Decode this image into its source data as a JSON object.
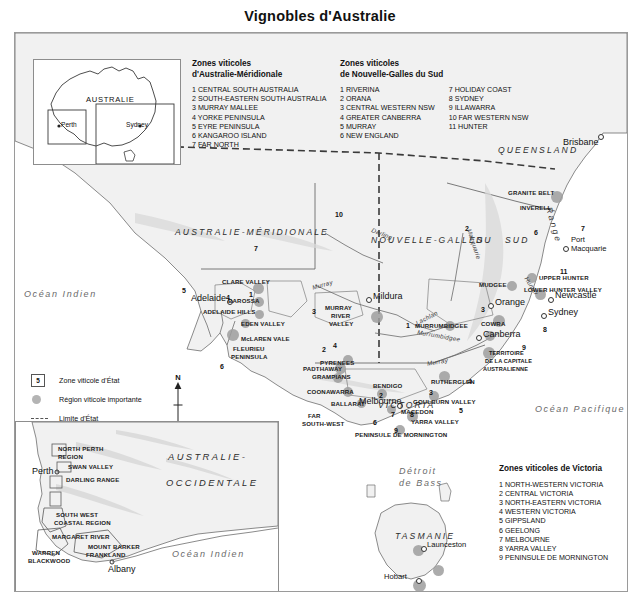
{
  "title": "Vignobles d'Australie",
  "legends": {
    "south_australia": {
      "title_line1": "Zones viticoles",
      "title_line2": "d'Australie-Méridionale",
      "items": [
        "1 CENTRAL SOUTH AUSTRALIA",
        "2 SOUTH-EASTERN SOUTH AUSTRALIA",
        "3 MURRAY MALLEE",
        "4 YORKE PENINSULA",
        "5 EYRE PENINSULA",
        "6 KANGAROO ISLAND",
        "7 FAR NORTH"
      ]
    },
    "new_south_wales": {
      "title_line1": "Zones viticoles",
      "title_line2": "de Nouvelle-Galles du Sud",
      "items_col1": [
        "1 RIVERINA",
        "2 ORANA",
        "3 CENTRAL WESTERN NSW",
        "4 GREATER CANBERRA",
        "5 MURRAY",
        "6 NEW ENGLAND"
      ],
      "items_col2": [
        "7 HOLIDAY COAST",
        "8 SYDNEY",
        "9 ILLAWARRA",
        "10 FAR WESTERN NSW",
        "11 HUNTER"
      ]
    },
    "victoria": {
      "title": "Zones viticoles de Victoria",
      "items": [
        "1 NORTH-WESTERN VICTORIA",
        "2 CENTRAL VICTORIA",
        "3 NORTH-EASTERN VICTORIA",
        "4 WESTERN VICTORIA",
        "5 GIPPSLAND",
        "6 GEELONG",
        "7 MELBOURNE",
        "8 YARRA VALLEY",
        "9 PENINSULE DE MORNINGTON"
      ]
    }
  },
  "map_key": {
    "zone_symbol_number": "5",
    "zone_label": "Zone viticole d'État",
    "region_label": "Région viticole importante",
    "border_label": "Limite d'État",
    "north_letter": "N"
  },
  "inset_locator": {
    "country_label": "AUSTRALIE",
    "city_west": "Perth",
    "city_east": "Sydney"
  },
  "inset_wa": {
    "state_line1": "AUSTRALIE-",
    "state_line2": "OCCIDENTALE",
    "ocean": "Océan Indien",
    "city_perth": "Perth",
    "city_albany": "Albany",
    "regions": [
      "NORTH PERTH",
      "REGION",
      "SWAN VALLEY",
      "DARLING RANGE",
      "SOUTH WEST",
      "COASTAL REGION",
      "MARGARET RIVER",
      "MOUNT BARKER",
      "FRANKLAND",
      "WARREN",
      "BLACKWOOD"
    ]
  },
  "map": {
    "states": [
      "AUSTRALIE-MÉRIDIONALE",
      "NOUVELLE-GALLES",
      "DU",
      "SUD",
      "QUEENSLAND",
      "VICTORIA",
      "TASMANIE"
    ],
    "oceans": [
      "Océan Indien",
      "Océan Pacifique",
      "Détroit",
      "de Bass"
    ],
    "rivers": [
      "Murray",
      "Darling",
      "Macquarie",
      "Lachlan",
      "Murrumbidgee",
      "Murray",
      "Hunter",
      "Range"
    ],
    "territory": [
      "TERRITOIRE",
      "DE LA CAPITALE",
      "AUSTRALIENNE"
    ],
    "cities": [
      "Brisbane",
      "Port",
      "Macquarie",
      "Newcastle",
      "Sydney",
      "Canberra",
      "Orange",
      "Adelaide",
      "Mildura",
      "Melbourne",
      "Launceston",
      "Hobart"
    ],
    "regions": [
      "GRANITE BELT",
      "INVERELL",
      "MUDGEE",
      "UPPER HUNTER",
      "LOWER HUNTER VALLEY",
      "MURRUMBIDGEE",
      "COWRA",
      "CLARE VALLEY",
      "BAROSSA",
      "ADELAIDE HILLS",
      "EDEN VALLEY",
      "McLAREN VALE",
      "FLEURIEU",
      "PENINSULA",
      "PADTHAWAY",
      "COONAWARRA",
      "MURRAY",
      "RIVER",
      "VALLEY",
      "PYRENEES",
      "GRAMPIANS",
      "BENDIGO",
      "MACEDON",
      "BALLARAT",
      "FAR",
      "SOUTH-WEST",
      "RUTHERGLEN",
      "GOULBURN VALLEY",
      "YARRA VALLEY",
      "PENINSULE DE MORNINGTON"
    ],
    "zone_numbers_sa": [
      "5",
      "4",
      "1",
      "6",
      "7",
      "3",
      "2"
    ],
    "zone_numbers_nsw": [
      "10",
      "2",
      "6",
      "7",
      "11",
      "3",
      "8",
      "9",
      "1",
      "4"
    ],
    "zone_numbers_vic": [
      "4",
      "2",
      "3",
      "5",
      "6",
      "7",
      "8",
      "9"
    ]
  },
  "scale": {
    "ticks": [
      "0",
      "100",
      "200",
      "300",
      "400",
      "500 km"
    ]
  }
}
